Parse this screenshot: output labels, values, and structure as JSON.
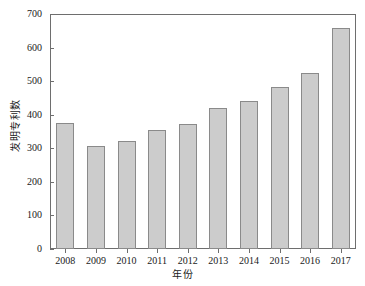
{
  "chart_data": {
    "type": "bar",
    "title": "",
    "xlabel": "年份",
    "ylabel": "发明专利数",
    "categories": [
      "2008",
      "2009",
      "2010",
      "2011",
      "2012",
      "2013",
      "2014",
      "2015",
      "2016",
      "2017"
    ],
    "values": [
      374,
      308,
      323,
      355,
      371,
      419,
      441,
      484,
      523,
      657
    ],
    "series": [
      {
        "name": "发明专利数",
        "values": [
          374,
          308,
          323,
          355,
          371,
          419,
          441,
          484,
          523,
          657
        ]
      }
    ],
    "ylim": [
      0,
      700
    ],
    "ytick_labels": [
      "0",
      "100",
      "200",
      "300",
      "400",
      "500",
      "600",
      "700"
    ],
    "ytick_values": [
      0,
      100,
      200,
      300,
      400,
      500,
      600,
      700
    ],
    "grid": false,
    "legend": false,
    "legend_position": "none",
    "bar_fill_color": "#cccccc",
    "bar_border_color": "#8a8a8a",
    "axis_color": "#6e6e6e",
    "text_color": "#1a1a1a",
    "background_color": "#ffffff"
  }
}
